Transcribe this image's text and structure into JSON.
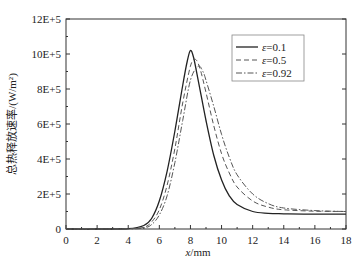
{
  "chart_data": {
    "type": "line",
    "title": "",
    "xlabel": "x/mm",
    "ylabel": "总热释放速率/(W/m²)",
    "xlim": [
      0,
      18
    ],
    "ylim": [
      0,
      1200000
    ],
    "x_ticks": [
      "0",
      "2",
      "4",
      "6",
      "8",
      "10",
      "12",
      "14",
      "16",
      "18"
    ],
    "y_ticks": [
      "0",
      "2E+5",
      "4E+5",
      "6E+5",
      "8E+5",
      "10E+5",
      "12E+5"
    ],
    "grid": false,
    "legend_position": "upper right",
    "series": [
      {
        "name": "ε=0.1",
        "style": "solid",
        "x": [
          0,
          2,
          4,
          5,
          5.5,
          6,
          6.5,
          7,
          7.5,
          7.8,
          8.0,
          8.2,
          8.5,
          9,
          9.5,
          10,
          10.5,
          11,
          12,
          13,
          14,
          16,
          18
        ],
        "values": [
          0,
          0,
          2000,
          20000,
          60000,
          160000,
          330000,
          560000,
          820000,
          960000,
          1020000,
          980000,
          850000,
          620000,
          420000,
          280000,
          190000,
          140000,
          100000,
          90000,
          87000,
          85000,
          85000
        ]
      },
      {
        "name": "ε=0.5",
        "style": "dashed",
        "x": [
          0,
          2,
          4,
          5,
          5.5,
          6,
          6.5,
          7,
          7.5,
          8.0,
          8.3,
          8.6,
          9,
          9.5,
          10,
          10.5,
          11,
          12,
          13,
          14,
          16,
          18
        ],
        "values": [
          0,
          0,
          1000,
          10000,
          40000,
          110000,
          250000,
          460000,
          720000,
          930000,
          970000,
          920000,
          780000,
          590000,
          430000,
          320000,
          240000,
          160000,
          125000,
          110000,
          102000,
          100000
        ]
      },
      {
        "name": "ε=0.92",
        "style": "dash-dot",
        "x": [
          0,
          2,
          4,
          5,
          5.5,
          6,
          6.5,
          7,
          7.5,
          8.0,
          8.5,
          8.8,
          9,
          9.5,
          10,
          10.5,
          11,
          12,
          13,
          14,
          16,
          18
        ],
        "values": [
          0,
          0,
          500,
          6000,
          25000,
          80000,
          190000,
          380000,
          620000,
          850000,
          930000,
          900000,
          850000,
          700000,
          540000,
          410000,
          310000,
          200000,
          145000,
          120000,
          105000,
          100000
        ]
      }
    ]
  },
  "legend": {
    "items": [
      {
        "label": "ε=0.1",
        "style": "solid"
      },
      {
        "label": "ε=0.5",
        "style": "dashed"
      },
      {
        "label": "ε=0.92",
        "style": "dash-dot"
      }
    ]
  },
  "axes": {
    "xlabel": "x/mm",
    "ylabel": "总热释放速率/(W/m²)"
  }
}
